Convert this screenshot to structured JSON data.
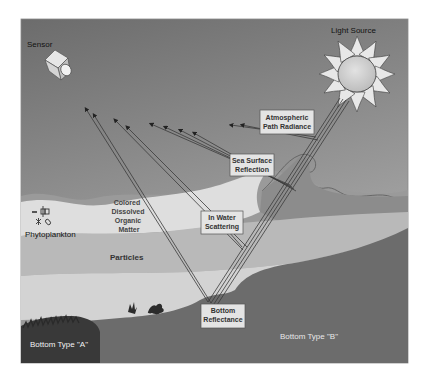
{
  "diagram": {
    "labels": {
      "sensor": "Sensor",
      "light_source": "Light Source",
      "atmospheric_path_radiance": [
        "Atmospheric",
        "Path Radiance"
      ],
      "sea_surface_reflection": [
        "Sea Surface",
        "Reflection"
      ],
      "in_water_scattering": [
        "In Water",
        "Scattering"
      ],
      "bottom_reflectance": [
        "Bottom",
        "Reflectance"
      ],
      "cdom": [
        "Colored",
        "Dissolved",
        "Organic",
        "Matter"
      ],
      "phytoplankton": "Phytoplankton",
      "particles": "Particles",
      "bottom_type_a": "Bottom Type \"A\"",
      "bottom_type_b": "Bottom Type \"B\""
    },
    "colors": {
      "sky_top": "#6e6e6e",
      "sky_bottom": "#a9a9a9",
      "cdom_layer": "#dcdcdc",
      "particles_layer": "#b8b8b8",
      "light_band": "#d0d0d0",
      "bottom_b": "#6b6b6b",
      "bottom_a": "#3a3a3a",
      "sun_fill": "#d6d6d6",
      "box_fill": "#e4e4e4",
      "ray": "#3c3c3c"
    }
  }
}
